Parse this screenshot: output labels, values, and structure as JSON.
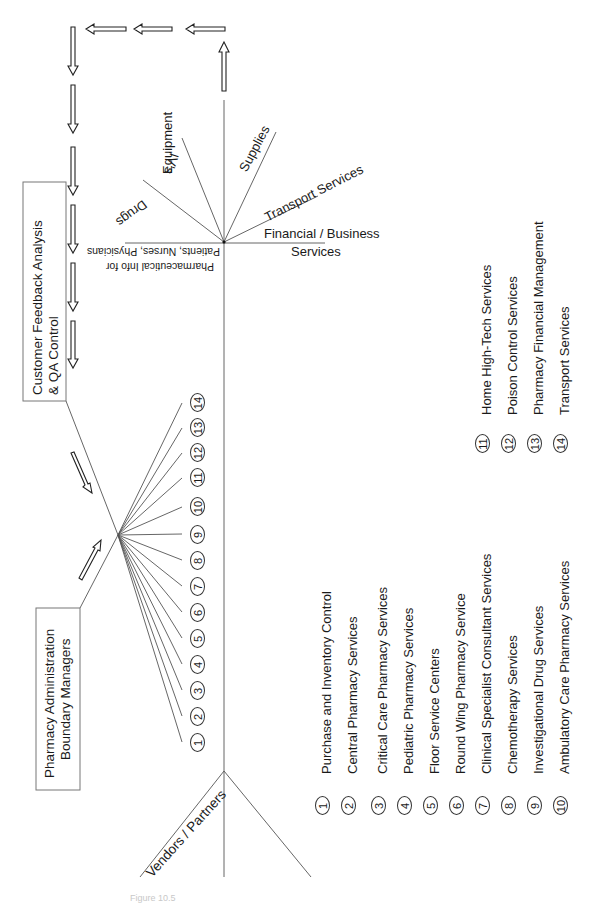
{
  "boxes": {
    "feedback": {
      "line1": "Customer Feedback Analysis",
      "line2": "& QA Control"
    },
    "admin": {
      "line1": "Pharmacy Administration",
      "line2": "Boundary Managers"
    }
  },
  "spokes": {
    "drugs": "Drugs",
    "ivs": "IV's",
    "equipment": "Equipment",
    "supplies": "Supplies",
    "transport": "Transport Services",
    "financial_line1": "Financial / Business",
    "financial_line2": "Services",
    "info_line1": "Pharmaceutical Info for",
    "info_line2": "Patients, Nurses, Physicians"
  },
  "vendors_label": "Vendors / Partners",
  "numbers": [
    "1",
    "2",
    "3",
    "4",
    "5",
    "6",
    "7",
    "8",
    "9",
    "10",
    "11",
    "12",
    "13",
    "14"
  ],
  "services": [
    {
      "num": "1",
      "label": "Purchase and Inventory Control"
    },
    {
      "num": "2",
      "label": "Central Pharmacy Services"
    },
    {
      "num": "3",
      "label": "Critical Care Pharmacy Services"
    },
    {
      "num": "4",
      "label": "Pediatric Pharmacy Services"
    },
    {
      "num": "5",
      "label": "Floor Service Centers"
    },
    {
      "num": "6",
      "label": "Round Wing Pharmacy Service"
    },
    {
      "num": "7",
      "label": "Clinical Specialist Consultant Services"
    },
    {
      "num": "8",
      "label": "Chemotherapy Services"
    },
    {
      "num": "9",
      "label": "Investigational Drug Services"
    },
    {
      "num": "10",
      "label": "Ambulatory Care Pharmacy Services"
    },
    {
      "num": "11",
      "label": "Home High-Tech Services"
    },
    {
      "num": "12",
      "label": "Poison Control Services"
    },
    {
      "num": "13",
      "label": "Pharmacy Financial Management"
    },
    {
      "num": "14",
      "label": "Transport Services"
    }
  ],
  "caption": "Figure 10.5"
}
